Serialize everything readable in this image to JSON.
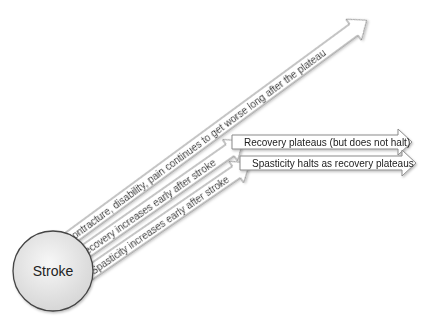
{
  "diagram": {
    "center_node": {
      "label": "Stroke",
      "fill": "#e6e6e6",
      "stroke": "#444444"
    },
    "arrows": [
      {
        "id": "contracture",
        "label": "Contracture, disability, pain continues to get worse long after the plateau",
        "direction": "diagonal"
      },
      {
        "id": "recovery-early",
        "label": "Recovery increases early after stroke",
        "direction": "diagonal"
      },
      {
        "id": "spasticity-early",
        "label": "Spasticity increases early after stroke",
        "direction": "diagonal"
      },
      {
        "id": "recovery-plateau",
        "label": "Recovery plateaus (but does not halt)",
        "direction": "horizontal"
      },
      {
        "id": "spasticity-halts",
        "label": "Spasticity halts as recovery plateaus",
        "direction": "horizontal"
      }
    ],
    "colors": {
      "arrow_fill": "#ffffff",
      "arrow_stroke": "#8a8a8a",
      "text": "#222222"
    }
  }
}
